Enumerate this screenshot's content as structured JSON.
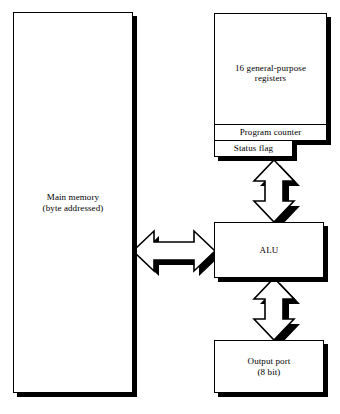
{
  "diagram": {
    "colors": {
      "fill": "#ffffff",
      "stroke": "#000000",
      "shadow": "#000000",
      "background": "#ffffff"
    },
    "blocks": {
      "main_memory": {
        "line1": "Main memory",
        "line2": "(byte addressed)"
      },
      "registers": {
        "line1": "16 general-purpose",
        "line2": "registers"
      },
      "program_counter": {
        "label": "Program counter"
      },
      "status_flag": {
        "label": "Status flag"
      },
      "alu": {
        "label": "ALU"
      },
      "output_port": {
        "line1": "Output port",
        "line2": "(8 bit)"
      }
    },
    "connectors": [
      {
        "name": "registers-to-alu",
        "style": "double-headed-block-arrow",
        "orientation": "vertical"
      },
      {
        "name": "alu-to-output-port",
        "style": "double-headed-block-arrow",
        "orientation": "vertical"
      },
      {
        "name": "main-memory-to-alu",
        "style": "double-headed-block-arrow",
        "orientation": "horizontal"
      }
    ]
  }
}
